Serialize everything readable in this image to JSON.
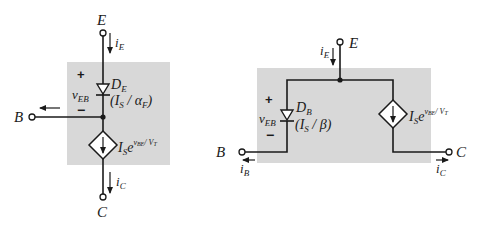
{
  "figure": {
    "left_model": {
      "name": "Transistor model (emitter diode)",
      "terminals": {
        "top": "E",
        "left": "B",
        "bottom": "C"
      },
      "currents": {
        "emitter": {
          "base": "i",
          "sub": "E"
        },
        "collector": {
          "base": "i",
          "sub": "C"
        }
      },
      "voltage": {
        "base": "v",
        "sub": "EB",
        "plus": "+",
        "minus": "−"
      },
      "diode": {
        "name_base": "D",
        "name_sub": "E",
        "param_open": "(I",
        "param_sub": "S",
        "param_mid": " / ",
        "param_sym": "α",
        "param_sym_sub": "F",
        "param_close": ")"
      },
      "source": {
        "base": "I",
        "sub": "S",
        "e": "e",
        "exp": "v",
        "exp_sub": "BE",
        "exp_tail": "/ V",
        "exp_tail_sub": "T"
      },
      "colors": {
        "box": "#d8d8d8",
        "line": "#1a1a1a"
      }
    },
    "right_model": {
      "name": "Transistor model (base diode)",
      "terminals": {
        "top": "E",
        "left": "B",
        "right": "C"
      },
      "currents": {
        "emitter": {
          "base": "i",
          "sub": "E"
        },
        "base_current": {
          "base": "i",
          "sub": "B"
        },
        "collector": {
          "base": "i",
          "sub": "C"
        }
      },
      "voltage": {
        "base": "v",
        "sub": "EB",
        "plus": "+",
        "minus": "−"
      },
      "diode": {
        "name_base": "D",
        "name_sub": "B",
        "param_open": "(I",
        "param_sub": "S",
        "param_mid": " / ",
        "param_sym": "β",
        "param_close": ")"
      },
      "source": {
        "base": "I",
        "sub": "S",
        "e": "e",
        "exp": "v",
        "exp_sub": "BE",
        "exp_tail": "/ V",
        "exp_tail_sub": "T"
      },
      "colors": {
        "box": "#d8d8d8",
        "line": "#1a1a1a"
      }
    }
  }
}
